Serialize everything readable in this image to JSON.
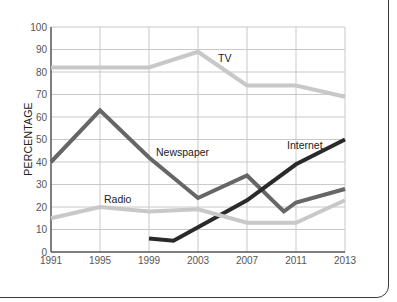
{
  "chart_data": {
    "type": "line",
    "title": "",
    "xlabel": "",
    "ylabel": "PERCENTAGE",
    "ylim": [
      0,
      100
    ],
    "yticks": [
      0,
      10,
      20,
      30,
      40,
      50,
      60,
      70,
      80,
      90,
      100
    ],
    "categories": [
      "1991",
      "1995",
      "1999",
      "2003",
      "2007",
      "2011",
      "2013"
    ],
    "grid": true,
    "legend": "inline labels",
    "series": [
      {
        "name": "TV",
        "color": "#c8c8c8",
        "points": [
          [
            1991,
            82
          ],
          [
            1995,
            82
          ],
          [
            1999,
            82
          ],
          [
            2003,
            89
          ],
          [
            2007,
            74
          ],
          [
            2011,
            74
          ],
          [
            2013,
            69
          ]
        ]
      },
      {
        "name": "Newspaper",
        "color": "#666666",
        "points": [
          [
            1991,
            40
          ],
          [
            1995,
            63
          ],
          [
            1999,
            42
          ],
          [
            2003,
            24
          ],
          [
            2007,
            34
          ],
          [
            2010,
            18
          ],
          [
            2011,
            22
          ],
          [
            2013,
            28
          ]
        ]
      },
      {
        "name": "Internet",
        "color": "#2a2a2a",
        "points": [
          [
            1999,
            6
          ],
          [
            2001,
            5
          ],
          [
            2003,
            11
          ],
          [
            2007,
            23
          ],
          [
            2011,
            39
          ],
          [
            2013,
            50
          ]
        ]
      },
      {
        "name": "Radio",
        "color": "#c8c8c8",
        "points": [
          [
            1991,
            15
          ],
          [
            1995,
            20
          ],
          [
            1999,
            18
          ],
          [
            2003,
            19
          ],
          [
            2007,
            13
          ],
          [
            2011,
            13
          ],
          [
            2013,
            23
          ]
        ]
      }
    ]
  },
  "labels": {
    "tv": "TV",
    "newspaper": "Newspaper",
    "internet": "Internet",
    "radio": "Radio"
  }
}
